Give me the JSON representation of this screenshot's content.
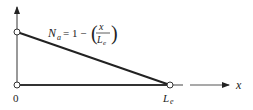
{
  "diagram": {
    "equation": {
      "lhs_symbol": "N",
      "lhs_subscript": "a",
      "equals_one_minus": "= 1 −",
      "numerator": "x",
      "denominator_symbol": "L",
      "denominator_subscript": "e",
      "open_paren": "(",
      "close_paren": ")"
    },
    "axes": {
      "x_label": "x",
      "origin_label": "0",
      "end_label_symbol": "L",
      "end_label_subscript": "e"
    },
    "nodes": [
      {
        "name": "node-origin-top",
        "value": 1
      },
      {
        "name": "node-origin-bottom",
        "value": 0
      },
      {
        "name": "node-end",
        "value": 0
      }
    ],
    "colors": {
      "line": "#222222",
      "axis": "#555555",
      "background": "#ffffff"
    }
  }
}
